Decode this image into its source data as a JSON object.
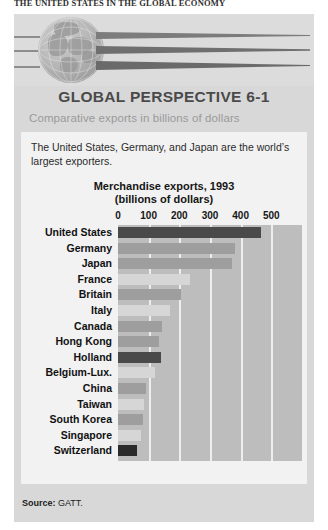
{
  "running_head": "THE UNITED STATES IN THE GLOBAL ECONOMY",
  "box": {
    "title": "GLOBAL PERSPECTIVE 6-1",
    "subtitle": "Comparative exports in billions of dollars",
    "blurb": "The United States, Germany, and Japan are the world’s largest exporters.",
    "source_label": "Source:",
    "source_value": "GATT."
  },
  "banner": {
    "globe_name": "globe-illustration",
    "streak_count": 3
  },
  "colors": {
    "panel_bg": "#d8d8d8",
    "card_bg": "#f2f2f2",
    "plot_bg": "#bdbdbd",
    "gridline": "#eeeeee",
    "bar_default": "#9e9e9e",
    "bar_highlight": "#4a4a4a",
    "bar_light": "#d6d6d6",
    "title_color": "#4a4a4a",
    "subtitle_color": "#9a9a9a"
  },
  "chart_data": {
    "type": "bar",
    "orientation": "horizontal",
    "title": "Merchandise exports, 1993",
    "subtitle": "(billions of dollars)",
    "xlabel": "",
    "ylabel": "",
    "xlim": [
      0,
      600
    ],
    "ticks": [
      0,
      100,
      200,
      300,
      400,
      500
    ],
    "tick_labels": [
      "0",
      "100",
      "200",
      "300",
      "400",
      "500"
    ],
    "grid": true,
    "legend": "none",
    "categories": [
      "United States",
      "Germany",
      "Japan",
      "France",
      "Britain",
      "Italy",
      "Canada",
      "Hong Kong",
      "Holland",
      "Belgium-Lux.",
      "China",
      "Taiwan",
      "South Korea",
      "Singapore",
      "Switzerland"
    ],
    "values": [
      465,
      380,
      372,
      235,
      205,
      170,
      145,
      135,
      140,
      120,
      92,
      85,
      82,
      74,
      63
    ],
    "highlight": [
      "Holland",
      "Switzerland"
    ],
    "bar_styles": [
      "dark",
      "default",
      "default",
      "light",
      "default",
      "light",
      "default",
      "default",
      "dark",
      "light",
      "default",
      "light",
      "default",
      "light",
      "darkest"
    ]
  }
}
